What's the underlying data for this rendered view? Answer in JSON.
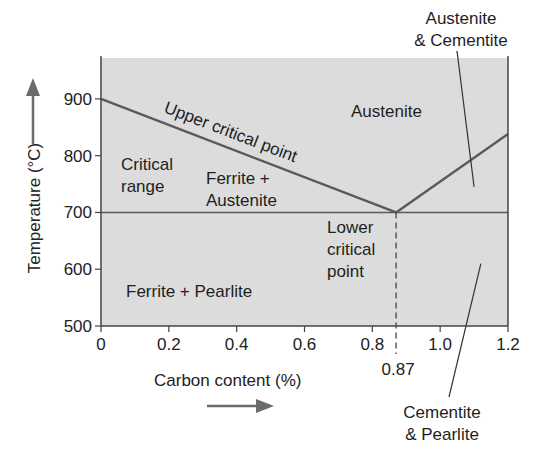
{
  "chart_data": {
    "type": "line",
    "title": "",
    "xlabel": "Carbon content (%)",
    "ylabel": "Temperature (°C)",
    "xlim": [
      0,
      1.2
    ],
    "ylim": [
      500,
      972
    ],
    "grid": false,
    "x_ticks": [
      0,
      0.2,
      0.4,
      0.6,
      0.8,
      1.0,
      1.2
    ],
    "x_tick_labels": [
      "0",
      "0.2",
      "0.4",
      "0.6",
      "0.8",
      "1.0",
      "1.2"
    ],
    "y_ticks": [
      500,
      600,
      700,
      800,
      900
    ],
    "y_tick_labels": [
      "500",
      "600",
      "700",
      "800",
      "900"
    ],
    "extra_x_tick": {
      "value": 0.87,
      "label": "0.87"
    },
    "series": [
      {
        "name": "Upper critical point (left)",
        "x": [
          0,
          0.87
        ],
        "y": [
          900,
          700
        ]
      },
      {
        "name": "Upper critical point (right)",
        "x": [
          0.87,
          1.2
        ],
        "y": [
          700,
          838
        ]
      },
      {
        "name": "Lower critical point",
        "x": [
          0,
          1.2
        ],
        "y": [
          700,
          700
        ]
      }
    ],
    "vertical_dashed_line": {
      "x": 0.87,
      "y_range": [
        500,
        700
      ]
    },
    "regions": [
      {
        "label": "Austenite",
        "x": 0.83,
        "y": 880
      },
      {
        "label": "Critical range",
        "lines": [
          "Critical",
          "range"
        ],
        "x": 0.08,
        "y": 770
      },
      {
        "label": "Ferrite + Austenite",
        "lines": [
          "Ferrite +",
          "Austenite"
        ],
        "x": 0.31,
        "y": 750
      },
      {
        "label": "Lower critical point",
        "lines": [
          "Lower",
          "critical",
          "point"
        ],
        "x": 0.67,
        "y": 640
      },
      {
        "label": "Ferrite + Pearlite",
        "x": 0.08,
        "y": 560
      }
    ],
    "annotations": [
      {
        "text": "Upper critical point",
        "along": "upper critical line"
      },
      {
        "text": "Austenite & Cemenite",
        "lines": [
          "Austenite",
          "& Cementite"
        ],
        "position": "top-right, outside plot",
        "points_to": {
          "x": 1.1,
          "y": 745
        }
      },
      {
        "text": "Cementite & Pearlite",
        "lines": [
          "Cementite",
          "& Pearlite"
        ],
        "position": "bottom-right, outside plot",
        "points_to": {
          "x": 1.12,
          "y": 610
        }
      }
    ],
    "axis_arrows": {
      "y": "up",
      "x": "right"
    }
  },
  "colors": {
    "plot_bg": "#dcdcdc",
    "line": "#5a5a5a",
    "axis": "#444444",
    "arrow": "#6b6b6b",
    "text": "#222222"
  }
}
